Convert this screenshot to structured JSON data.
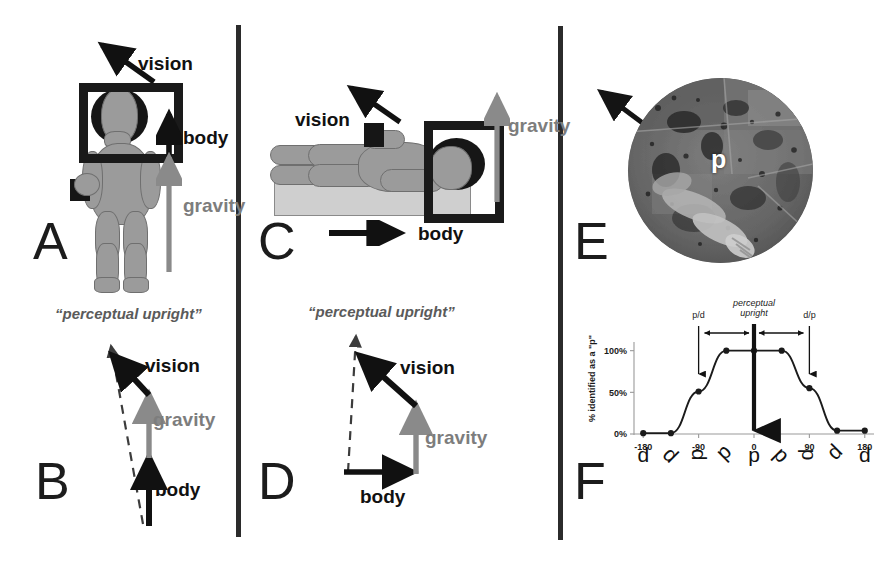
{
  "figure": {
    "width": 891,
    "height": 561,
    "background": "#ffffff",
    "divider_color": "#2b2b2b"
  },
  "colors": {
    "body_vector": "#111111",
    "vision_vector": "#111111",
    "gravity_vector": "#7d7d7d",
    "perceptual_upright": "#5a5a5a",
    "mannequin_fill": "#9b9b9b",
    "mannequin_stroke": "#6f6f6f",
    "frame": "#1a1a1a",
    "platform": "#cfcfcf"
  },
  "panels": [
    {
      "id": "A",
      "letter": "A",
      "caption_role": "upright-observer-illustration",
      "labels": {
        "vision": "vision",
        "body": "body",
        "gravity": "gravity"
      }
    },
    {
      "id": "B",
      "letter": "B",
      "caption_role": "upright-vector-sum-diagram",
      "labels": {
        "perceptual_upright": "“perceptual upright”",
        "vision": "vision",
        "gravity": "gravity",
        "body": "body"
      }
    },
    {
      "id": "C",
      "letter": "C",
      "caption_role": "supine-observer-illustration",
      "labels": {
        "vision": "vision",
        "gravity": "gravity",
        "body": "body"
      }
    },
    {
      "id": "D",
      "letter": "D",
      "caption_role": "supine-vector-sum-diagram",
      "labels": {
        "perceptual_upright": "“perceptual upright”",
        "vision": "vision",
        "gravity": "gravity",
        "body": "body"
      }
    },
    {
      "id": "E",
      "letter": "E",
      "caption_role": "goggle-view-photo",
      "labels": {
        "stimulus_letter": "d"
      }
    },
    {
      "id": "F",
      "letter": "F",
      "caption_role": "probability-function-chart"
    }
  ],
  "chart_data": {
    "type": "line",
    "title": "",
    "xlabel": "",
    "ylabel": "% identified as a \"p\"",
    "x": [
      -180,
      -135,
      -90,
      -45,
      0,
      45,
      90,
      135,
      180
    ],
    "values": [
      1,
      1,
      51,
      100,
      100,
      100,
      55,
      4,
      4
    ],
    "xlim": [
      -195,
      195
    ],
    "ylim": [
      0,
      108
    ],
    "xticks": [
      -180,
      -90,
      0,
      90,
      180
    ],
    "xtick_labels": [
      "-180",
      "-90",
      "0",
      "90",
      "180"
    ],
    "yticks": [
      0,
      50,
      100
    ],
    "ytick_labels": [
      "0%",
      "50%",
      "100%"
    ],
    "grid": false,
    "legend": false,
    "markers": "filled-circle",
    "glyph_row": [
      "d",
      "d",
      "d",
      "d",
      "p",
      "p",
      "p",
      "p",
      "d"
    ],
    "glyph_rotations": [
      0,
      45,
      90,
      135,
      0,
      45,
      90,
      135,
      0
    ],
    "annotations": [
      {
        "name": "p-to-d-transition",
        "label": "p/d",
        "x": -90
      },
      {
        "name": "perceptual-upright-marker",
        "label": "perceptual upright",
        "x": 0
      },
      {
        "name": "d-to-p-transition",
        "label": "d/p",
        "x": 90
      }
    ],
    "span_arrows": [
      {
        "name": "left-span",
        "from": -90,
        "to": 0
      },
      {
        "name": "right-span",
        "from": 0,
        "to": 90
      }
    ]
  }
}
